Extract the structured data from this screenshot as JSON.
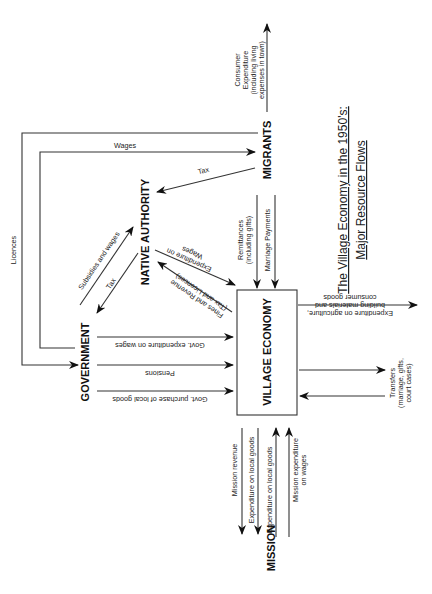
{
  "title": {
    "line1": "The Village Economy in the 1950's:",
    "line2": "Major Resource Flows"
  },
  "nodes": {
    "migrants": "MIGRANTS",
    "native_authority": "NATIVE AUTHORITY",
    "government": "GOVERNMENT",
    "village_economy": "VILLAGE ECONOMY",
    "mission": "MISSION"
  },
  "flows": {
    "consumer_expenditure": [
      "Consumer",
      "Expenditure",
      "(including living",
      "expenses in town)"
    ],
    "wages": "Wages",
    "licences": "Licences",
    "tax_migrants": "Tax",
    "subsidies_and_wages": "Subsidies and wages",
    "tax_na_to_gov": "Tax",
    "remittances": [
      "Remittances",
      "(including gifts)"
    ],
    "marriage_payments": "Marriage Payments",
    "na_expenditure_on_wages": [
      "Expenditure on",
      "Wages"
    ],
    "fines_and_revenue": [
      "Fines and Revenue",
      "(Tax and Licences)"
    ],
    "gov_expenditure_on_wages": "Govt. expenditure on wages",
    "pensions": "Pensions",
    "gov_purchase_local_goods": "Govt. purchase of local goods",
    "expenditure_agriculture": [
      "Expenditure on agriculture,",
      "building materials and",
      "consumer goods"
    ],
    "transfers": [
      "Transfers",
      "(marriage, gifts,",
      "court cases)"
    ],
    "mission_revenue": "Mission revenue",
    "expenditure_local_goods_1": "Expenditure on local goods",
    "expenditure_local_goods_2": "Expenditure on local goods",
    "mission_expenditure_wages": [
      "Mission expenditure",
      "on wages"
    ]
  }
}
